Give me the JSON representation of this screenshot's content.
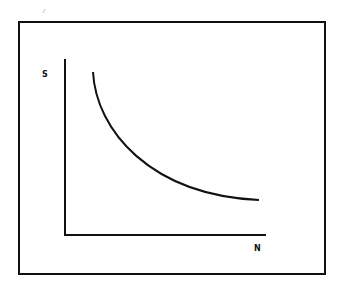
{
  "diagram": {
    "axes": {
      "y_label": "S",
      "x_label": "N"
    },
    "curve": {
      "shape": "decreasing convex (hyperbolic-like)",
      "start": "high S at low N",
      "end": "low S, flattening at high N"
    },
    "colors": {
      "stroke": "#111111",
      "background": "#ffffff"
    }
  }
}
